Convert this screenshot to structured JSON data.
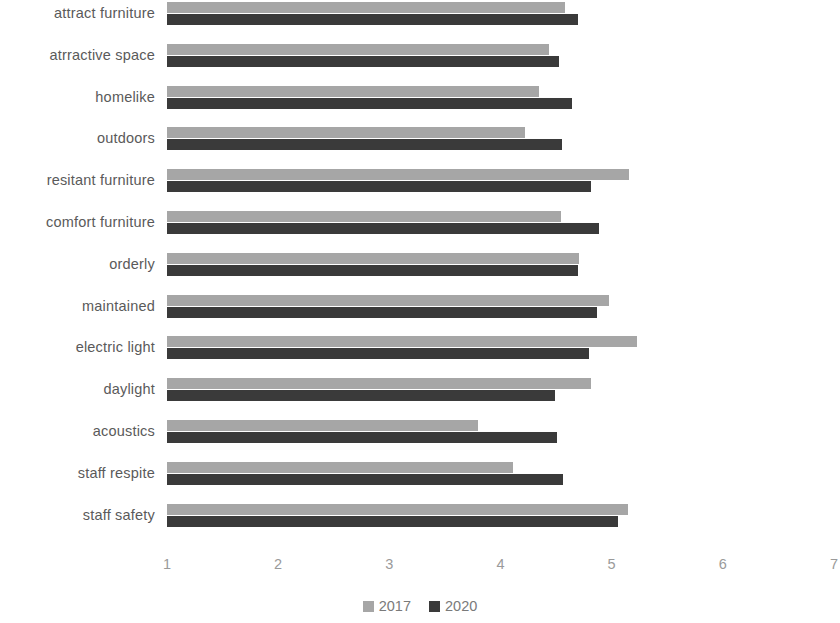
{
  "chart_data": {
    "type": "bar",
    "orientation": "horizontal",
    "title": "",
    "subtitle": "",
    "xlabel": "",
    "ylabel": "",
    "xlim": [
      1,
      7
    ],
    "xticks": [
      "1",
      "2",
      "3",
      "4",
      "5",
      "6",
      "7"
    ],
    "grid": false,
    "legend_position": "bottom",
    "categories": [
      "attract furniture",
      "atrractive space",
      "homelike",
      "outdoors",
      "resitant furniture",
      "comfort furniture",
      "orderly",
      "maintained",
      "electric light",
      "daylight",
      "acoustics",
      "staff respite",
      "staff safety"
    ],
    "series": [
      {
        "name": "2017",
        "color": "#a6a6a6",
        "values": [
          4.58,
          4.44,
          4.35,
          4.22,
          5.16,
          4.54,
          4.71,
          4.98,
          5.23,
          4.81,
          3.8,
          4.11,
          5.15
        ]
      },
      {
        "name": "2020",
        "color": "#3a3a3a",
        "values": [
          4.7,
          4.53,
          4.64,
          4.55,
          4.81,
          4.89,
          4.7,
          4.87,
          4.8,
          4.49,
          4.51,
          4.56,
          5.06
        ]
      }
    ]
  }
}
